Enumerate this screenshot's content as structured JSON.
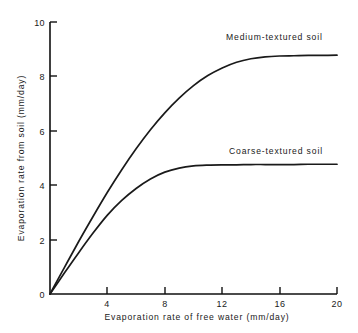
{
  "chart_data": {
    "type": "line",
    "title": "",
    "xlabel": "Evaporation rate of free water (mm/day)",
    "ylabel": "Evaporation rate from soil (mm/day)",
    "xlim": [
      0,
      20
    ],
    "ylim": [
      0,
      10
    ],
    "xticks": [
      0,
      4,
      8,
      12,
      16,
      20
    ],
    "yticks": [
      0,
      2,
      4,
      6,
      8,
      10
    ],
    "xticklabels": [
      "0",
      "4",
      "8",
      "12",
      "16",
      "20"
    ],
    "yticklabels": [
      "0",
      "2",
      "4",
      "6",
      "8",
      "10"
    ],
    "grid": false,
    "legend": "inline-annotations",
    "series": [
      {
        "name": "Medium-textured soil",
        "annotation": "Medium-textured soil",
        "initial_slope": 1.0,
        "plateau": 8.75,
        "x": [
          0,
          1,
          2,
          3,
          4,
          5,
          6,
          7,
          8,
          9,
          10,
          11,
          12,
          13,
          14,
          15,
          16,
          17,
          18,
          19,
          20
        ],
        "values": [
          0,
          0.97,
          1.93,
          2.85,
          3.74,
          4.57,
          5.34,
          6.04,
          6.66,
          7.2,
          7.66,
          8.03,
          8.31,
          8.52,
          8.65,
          8.72,
          8.75,
          8.76,
          8.77,
          8.77,
          8.78
        ]
      },
      {
        "name": "Coarse-textured soil",
        "annotation": "Coarse-textured soil",
        "initial_slope": 0.78,
        "plateau": 4.75,
        "x": [
          0,
          1,
          2,
          3,
          4,
          5,
          6,
          7,
          8,
          9,
          10,
          11,
          12,
          13,
          14,
          15,
          16,
          17,
          18,
          19,
          20
        ],
        "values": [
          0,
          0.77,
          1.52,
          2.24,
          2.9,
          3.44,
          3.88,
          4.23,
          4.48,
          4.63,
          4.71,
          4.74,
          4.75,
          4.75,
          4.76,
          4.76,
          4.76,
          4.76,
          4.77,
          4.77,
          4.77
        ]
      }
    ]
  },
  "axes": {
    "x_title": "Evaporation rate of free water (mm/day)",
    "y_title": "Evaporation rate from soil (mm/day)"
  },
  "annotations": {
    "medium": "Medium-textured soil",
    "coarse": "Coarse-textured soil"
  },
  "ticklabels": {
    "x": [
      "0",
      "4",
      "8",
      "12",
      "16",
      "20"
    ],
    "y": [
      "0",
      "2",
      "4",
      "6",
      "8",
      "10"
    ]
  },
  "colors": {
    "ink": "#1a1a1a",
    "background": "#ffffff"
  }
}
